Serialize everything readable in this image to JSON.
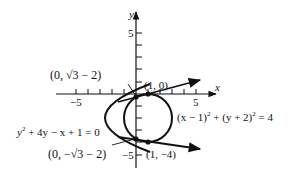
{
  "axes": {
    "x_label": "x",
    "y_label": "y",
    "x_tick_neg": "−5",
    "x_tick_pos": "5",
    "y_tick_pos": "5",
    "y_tick_neg": "−5",
    "x_range": [
      -5,
      6
    ],
    "y_range": [
      -6,
      6
    ]
  },
  "curves": {
    "parabola": {
      "equation": "y² + 4y − x + 1 = 0",
      "eq_base": "y",
      "eq_rest": " + 4y − x + 1 = 0",
      "vertex": [
        -3,
        -2
      ]
    },
    "circle": {
      "equation": "(x − 1)² + (y + 2)² = 4",
      "eq_part1": "(x − 1)",
      "eq_part2": " + (y + 2)",
      "eq_part3": " = 4",
      "center": [
        1,
        -2
      ],
      "radius": 2
    }
  },
  "points": {
    "upper_intersection": {
      "label_prefix": "(0, ",
      "label_root": "√3",
      "label_suffix": " − 2)",
      "coords": [
        0,
        -0.268
      ]
    },
    "lower_intersection": {
      "label_prefix": "(0, −",
      "label_root": "√3",
      "label_suffix": " − 2)",
      "coords": [
        0,
        -3.732
      ]
    },
    "tangent_top": {
      "label": "(1, 0)",
      "coords": [
        1,
        0
      ]
    },
    "tangent_bottom": {
      "label": "(1, −4)",
      "coords": [
        1,
        -4
      ]
    }
  },
  "superscripts": {
    "two": "2"
  },
  "colors": {
    "stroke": "#111111",
    "background": "#ffffff"
  }
}
